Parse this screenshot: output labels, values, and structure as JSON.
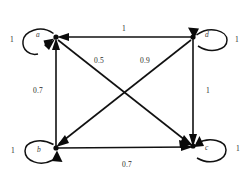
{
  "figure": {
    "type": "directed-weighted-graph",
    "background_color": "#ffffff",
    "stroke_color": "#111111",
    "text_color": "#2a2a2a"
  },
  "nodes": [
    {
      "id": "a",
      "label": "a",
      "x": 56,
      "y": 37,
      "self_loop_weight": "1",
      "self_loop_side": "left"
    },
    {
      "id": "d",
      "label": "d",
      "x": 193,
      "y": 37,
      "self_loop_weight": "1",
      "self_loop_side": "right"
    },
    {
      "id": "b",
      "label": "b",
      "x": 56,
      "y": 148,
      "self_loop_weight": "1",
      "self_loop_side": "left"
    },
    {
      "id": "c",
      "label": "c",
      "x": 193,
      "y": 146,
      "self_loop_weight": "1",
      "self_loop_side": "right"
    }
  ],
  "edges": [
    {
      "from": "d",
      "to": "a",
      "weight": "1",
      "name": "edge-d-a-top"
    },
    {
      "from": "b",
      "to": "a",
      "weight": "0.7",
      "name": "edge-b-a-left"
    },
    {
      "from": "d",
      "to": "c",
      "weight": "1",
      "name": "edge-d-c-right"
    },
    {
      "from": "b",
      "to": "c",
      "weight": "0.7",
      "name": "edge-b-c-bottom"
    },
    {
      "from": "a",
      "to": "c",
      "weight": "0.5",
      "name": "edge-a-c-diagonal"
    },
    {
      "from": "d",
      "to": "b",
      "weight": "0.9",
      "name": "edge-d-b-diagonal"
    }
  ],
  "labels": {
    "node_a": "a",
    "node_b": "b",
    "node_c": "c",
    "node_d": "d",
    "loop_a": "1",
    "loop_b": "1",
    "loop_c": "1",
    "loop_d": "1",
    "edge_top": "1",
    "edge_left": "0.7",
    "edge_right": "1",
    "edge_bottom": "0.7",
    "diag_a_c": "0.5",
    "diag_d_b": "0.9"
  }
}
